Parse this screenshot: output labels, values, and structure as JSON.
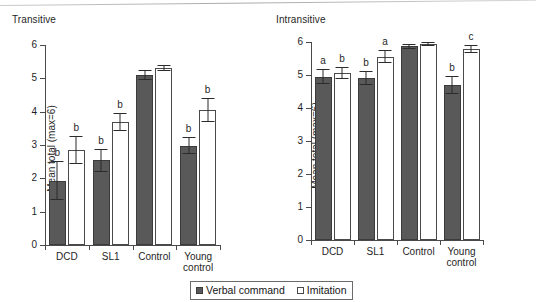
{
  "figure": {
    "legend": [
      {
        "key": "verbal",
        "label": "Verbal command",
        "swatch": "dark",
        "color": "#595959"
      },
      {
        "key": "imitation",
        "label": "Imitation",
        "swatch": "light",
        "color": "#ffffff"
      }
    ]
  },
  "chart_data": [
    {
      "id": "transitive",
      "type": "bar",
      "title": "Transitive",
      "xlabel": "",
      "ylabel": "Mean total (max=6)",
      "ylim": [
        0,
        6
      ],
      "yticks": [
        0,
        1,
        2,
        3,
        4,
        5,
        6
      ],
      "ytick_labels": [
        "0",
        "1",
        "2",
        "3",
        "4",
        "5",
        "6"
      ],
      "grid": false,
      "legend_position": "bottom-center-shared",
      "categories": [
        "DCD",
        "SL1",
        "Control",
        "Young\ncontrol"
      ],
      "series": [
        {
          "name": "Verbal command",
          "color": "#595959",
          "values": [
            1.93,
            2.54,
            5.1,
            2.98
          ],
          "errors": [
            0.58,
            0.35,
            0.14,
            0.26
          ],
          "annotations": [
            "b",
            "b",
            "",
            "b"
          ]
        },
        {
          "name": "Imitation",
          "color": "#ffffff",
          "values": [
            2.85,
            3.69,
            5.31,
            4.05
          ],
          "errors": [
            0.42,
            0.28,
            0.1,
            0.37
          ],
          "annotations": [
            "b",
            "b",
            "",
            "b"
          ]
        }
      ]
    },
    {
      "id": "intransitive",
      "type": "bar",
      "title": "Intransitive",
      "xlabel": "",
      "ylabel": "Mean total (max=6)",
      "ylim": [
        0,
        6
      ],
      "yticks": [
        0,
        1,
        2,
        3,
        4,
        5,
        6
      ],
      "ytick_labels": [
        "0",
        "1",
        "2",
        "3",
        "4",
        "5",
        "6"
      ],
      "grid": false,
      "legend_position": "bottom-center-shared",
      "categories": [
        "DCD",
        "SL1",
        "Control",
        "Young\ncontrol"
      ],
      "series": [
        {
          "name": "Verbal command",
          "color": "#595959",
          "values": [
            4.95,
            4.91,
            5.87,
            4.69
          ],
          "errors": [
            0.22,
            0.22,
            0.08,
            0.28
          ],
          "annotations": [
            "a",
            "b",
            "",
            "b"
          ]
        },
        {
          "name": "Imitation",
          "color": "#ffffff",
          "values": [
            5.05,
            5.55,
            5.93,
            5.79
          ],
          "errors": [
            0.18,
            0.2,
            0.06,
            0.13
          ],
          "annotations": [
            "b",
            "a",
            "",
            "c"
          ]
        }
      ]
    }
  ]
}
